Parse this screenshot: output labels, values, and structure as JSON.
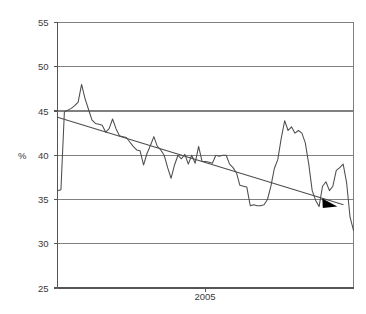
{
  "chart_data": {
    "type": "line",
    "title": "",
    "subtitle": "",
    "xlabel": "",
    "ylabel": "%",
    "ylim": [
      25,
      55
    ],
    "ytick_values": [
      25,
      30,
      35,
      40,
      45,
      50,
      55
    ],
    "ytick_labels": [
      "25",
      "30",
      "35",
      "40",
      "45",
      "50",
      "55"
    ],
    "xtick_labels": [
      "2005"
    ],
    "xtick_positions": [
      0.5
    ],
    "grid": "horizontal",
    "legend": "none",
    "legend_position": "none",
    "annotations": [
      {
        "name": "trend-arrowhead",
        "shape": "filled-triangle",
        "direction": "right",
        "color": "#000000",
        "x_frac": 0.925,
        "value": 34.5
      }
    ],
    "series": [
      {
        "name": "share",
        "color": "#4d4d4d",
        "style": "solid",
        "values": [
          36.0,
          36.1,
          44.9,
          45.1,
          45.3,
          45.6,
          46.0,
          48.0,
          46.4,
          45.2,
          44.0,
          43.6,
          43.5,
          43.4,
          42.6,
          43.0,
          44.1,
          43.0,
          42.2,
          42.1,
          42.0,
          41.5,
          41.0,
          40.6,
          40.5,
          38.9,
          40.2,
          41.1,
          42.1,
          41.0,
          40.6,
          40.0,
          38.6,
          37.4,
          38.9,
          40.0,
          39.6,
          40.1,
          39.0,
          40.0,
          39.1,
          41.0,
          39.3,
          39.3,
          39.2,
          39.1,
          40.0,
          39.9,
          40.0,
          40.0,
          39.0,
          38.6,
          38.0,
          36.6,
          36.5,
          36.4,
          34.3,
          34.4,
          34.3,
          34.3,
          34.4,
          35.0,
          36.5,
          38.5,
          39.5,
          41.9,
          43.9,
          42.8,
          43.2,
          42.5,
          42.8,
          42.5,
          41.4,
          39.0,
          36.0,
          34.9,
          34.2,
          36.5,
          37.0,
          36.0,
          36.5,
          38.3,
          38.6,
          39.0,
          36.9,
          33.0,
          31.5
        ]
      },
      {
        "name": "trend",
        "color": "#4d4d4d",
        "style": "solid",
        "start_value": 44.3,
        "end_value": 34.4
      }
    ]
  },
  "axis": {
    "y_title": "%",
    "x_label_2005": "2005"
  }
}
